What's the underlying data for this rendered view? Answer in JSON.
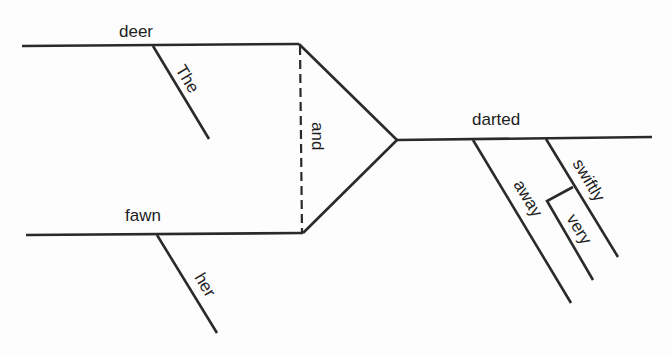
{
  "diagram": {
    "type": "sentence-diagram",
    "words": {
      "subject_1": "deer",
      "subject_1_modifier": "The",
      "conjunction": "and",
      "subject_2": "fawn",
      "subject_2_modifier": "her",
      "verb": "darted",
      "verb_modifier_1": "away",
      "verb_modifier_2": "swiftly",
      "adverb_modifier": "very"
    },
    "colors": {
      "line": "#2a2a2a",
      "text": "#1e1e1e",
      "background": "#fdfdfd"
    }
  }
}
